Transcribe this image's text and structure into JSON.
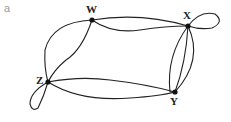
{
  "panel_label": "a",
  "graph": {
    "vertices": [
      {
        "id": "W",
        "label": "W",
        "x": 92,
        "y": 20
      },
      {
        "id": "X",
        "label": "X",
        "x": 188,
        "y": 26
      },
      {
        "id": "Y",
        "label": "Y",
        "x": 175,
        "y": 92
      },
      {
        "id": "Z",
        "label": "Z",
        "x": 48,
        "y": 82
      }
    ],
    "edges": [
      {
        "from": "W",
        "to": "X",
        "multiplicity": 2
      },
      {
        "from": "W",
        "to": "Z",
        "multiplicity": 2
      },
      {
        "from": "Z",
        "to": "Y",
        "multiplicity": 2
      },
      {
        "from": "X",
        "to": "Y",
        "multiplicity": 3
      },
      {
        "from": "X",
        "to": "X",
        "type": "loop"
      },
      {
        "from": "Z",
        "to": "Z",
        "type": "loop"
      }
    ],
    "colors": {
      "edge": "#222222",
      "vertex": "#111111"
    }
  }
}
